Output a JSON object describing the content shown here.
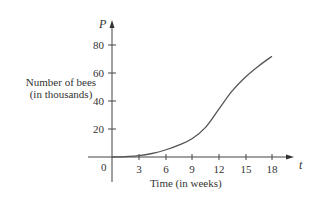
{
  "chart_data": {
    "type": "line",
    "title": "",
    "xlabel": "Time (in weeks)",
    "ylabel": "Number of bees (in thousands)",
    "x_axis_variable": "t",
    "y_axis_variable": "P",
    "x_ticks": [
      3,
      6,
      9,
      12,
      15,
      18
    ],
    "y_ticks": [
      20,
      40,
      60,
      80
    ],
    "origin_label": "0",
    "xlim": [
      0,
      19
    ],
    "ylim": [
      0,
      90
    ],
    "grid": false,
    "legend": null,
    "series": [
      {
        "name": "P(t)",
        "x": [
          0,
          1.5,
          3,
          4.5,
          6,
          7.5,
          9,
          10.5,
          12,
          13.5,
          15,
          16.5,
          18
        ],
        "values": [
          0,
          0.3,
          1,
          2.5,
          5,
          8.5,
          13,
          21,
          34,
          47,
          57,
          65,
          72
        ]
      }
    ]
  },
  "labels": {
    "ylabel_line1": "Number of bees",
    "ylabel_line2": "(in thousands)",
    "xlabel": "Time (in weeks)",
    "x_var": "t",
    "y_var": "P",
    "origin": "0",
    "x_ticks": [
      "3",
      "6",
      "9",
      "12",
      "15",
      "18"
    ],
    "y_ticks": [
      "20",
      "40",
      "60",
      "80"
    ]
  }
}
